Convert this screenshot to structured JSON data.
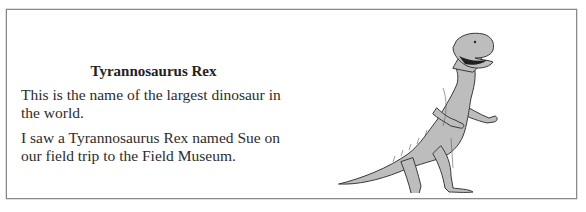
{
  "card": {
    "title": "Tyrannosaurus Rex",
    "paragraphs": [
      "This is the name of the largest dinosaur in the world.",
      "I saw a Tyrannosaurus Rex named Sue on our field trip to the Field Museum."
    ],
    "illustration": {
      "icon": "tyrannosaurus-rex-illustration",
      "fill_color": "#bdbdbd",
      "outline_color": "#3a3a3a"
    }
  }
}
